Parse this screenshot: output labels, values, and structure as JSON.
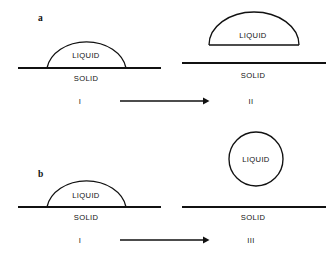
{
  "figure": {
    "panels": [
      {
        "letter": "a",
        "letter_x": 38,
        "letter_y": 21,
        "states": [
          {
            "numeral": "I",
            "numeral_x": 80,
            "numeral_y": 104,
            "liquid_label": "LIQUID",
            "solid_label": "SOLID",
            "liquid_x": 86,
            "liquid_y": 58,
            "solid_x": 86,
            "solid_y": 81,
            "shape": "sessile-dome",
            "surface_x1": 18,
            "surface_x2": 161,
            "surface_y": 68,
            "dome_left": 47,
            "dome_right": 126,
            "dome_apex_y": 37
          },
          {
            "numeral": "II",
            "numeral_x": 251,
            "numeral_y": 104,
            "liquid_label": "LIQUID",
            "solid_label": "SOLID",
            "liquid_x": 253,
            "liquid_y": 38,
            "solid_x": 253,
            "solid_y": 78,
            "shape": "detached-dome",
            "surface_x1": 182,
            "surface_x2": 326,
            "surface_y": 63,
            "dome_left": 209,
            "dome_right": 299,
            "dome_apex_y": 12,
            "dome_base_y": 45
          }
        ],
        "arrow": {
          "x1": 120,
          "x2": 208,
          "y": 101
        }
      },
      {
        "letter": "b",
        "letter_x": 38,
        "letter_y": 177,
        "states": [
          {
            "numeral": "I",
            "numeral_x": 80,
            "numeral_y": 243,
            "liquid_label": "LIQUID",
            "solid_label": "SOLID",
            "liquid_x": 86,
            "liquid_y": 198,
            "solid_x": 86,
            "solid_y": 220,
            "shape": "sessile-dome",
            "surface_x1": 18,
            "surface_x2": 161,
            "surface_y": 207,
            "dome_left": 47,
            "dome_right": 126,
            "dome_apex_y": 176
          },
          {
            "numeral": "III",
            "numeral_x": 251,
            "numeral_y": 243,
            "liquid_label": "LIQUID",
            "solid_label": "SOLID",
            "liquid_x": 256,
            "liquid_y": 162,
            "solid_x": 253,
            "solid_y": 220,
            "shape": "free-sphere",
            "surface_x1": 182,
            "surface_x2": 326,
            "surface_y": 207,
            "circle_cx": 256,
            "circle_cy": 159,
            "circle_r": 27
          }
        ],
        "arrow": {
          "x1": 120,
          "x2": 208,
          "y": 240
        }
      }
    ],
    "colors": {
      "ink": "#111111",
      "background": "#ffffff"
    }
  }
}
